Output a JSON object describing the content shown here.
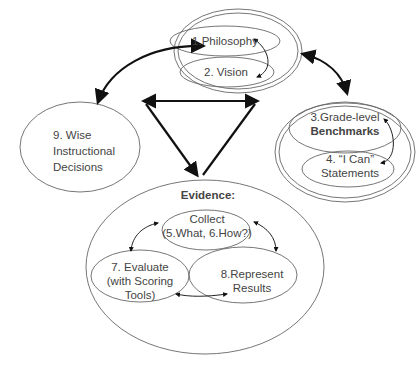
{
  "diagram": {
    "nodes": {
      "philosophy": {
        "label": "1.Philosophy"
      },
      "vision": {
        "label": "2. Vision"
      },
      "benchmarks": {
        "line1": "3.Grade-level",
        "line2": "Benchmarks"
      },
      "ican": {
        "line1": "4. “I Can”",
        "line2": "Statements"
      },
      "evidence": {
        "label": "Evidence:"
      },
      "collect": {
        "line1": "Collect",
        "line2": "(5.What, 6.How?)"
      },
      "evaluate": {
        "line1": "7. Evaluate",
        "line2": "(with Scoring",
        "line3": "Tools)"
      },
      "represent": {
        "line1": "8.Represent",
        "line2": "Results"
      },
      "wise": {
        "line1": "9. Wise",
        "line2": "Instructional",
        "line3": "Decisions"
      }
    },
    "edges": [
      {
        "from": "philosophy",
        "to": "vision",
        "type": "bidirectional"
      },
      {
        "from": "benchmarks",
        "to": "ican",
        "type": "bidirectional"
      },
      {
        "from": "collect",
        "to": "evaluate",
        "type": "bidirectional"
      },
      {
        "from": "collect",
        "to": "represent",
        "type": "bidirectional"
      },
      {
        "from": "evaluate",
        "to": "represent",
        "type": "bidirectional"
      },
      {
        "from": "philosophy-vision-group",
        "to": "wise",
        "type": "bidirectional"
      },
      {
        "from": "philosophy-vision-group",
        "to": "benchmarks-ican-group",
        "type": "bidirectional"
      },
      {
        "from": "triangle",
        "to": "evidence-group",
        "type": "triangle"
      }
    ],
    "colors": {
      "stroke": "#666666",
      "arrow": "#111111",
      "text": "#444444"
    }
  }
}
